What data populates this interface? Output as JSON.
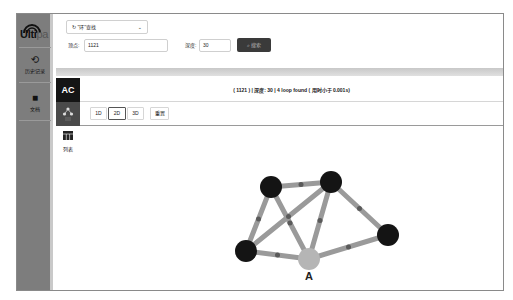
{
  "sidebar": {
    "logo": "Ultipa",
    "items": [
      {
        "label": "历史记录",
        "icon": "history-icon"
      },
      {
        "label": "文档",
        "icon": "document-icon"
      }
    ]
  },
  "query": {
    "mode_select": "\"环\"查找",
    "mode_icon": "loop-icon",
    "vertex_label": "顶点:",
    "vertex_value": "1121",
    "depth_label": "深度:",
    "depth_value": "30",
    "search_button": "搜索"
  },
  "result": {
    "tab_ac": "AC",
    "tab_list_label": "列表",
    "status": "( 1121 ) | 深度: 30 | 4 loop found ( 用时小于 0.001s)",
    "toolbar": [
      "1D",
      "2D",
      "3D",
      "重置"
    ],
    "active_view": "2D"
  },
  "graph": {
    "nodes": [
      {
        "id": "n1",
        "x": 254,
        "y": 173,
        "color": "#141414"
      },
      {
        "id": "n2",
        "x": 314,
        "y": 168,
        "color": "#141414"
      },
      {
        "id": "n3",
        "x": 371,
        "y": 221,
        "color": "#141414"
      },
      {
        "id": "n4",
        "x": 229,
        "y": 237,
        "color": "#141414"
      },
      {
        "id": "A",
        "x": 292,
        "y": 245,
        "color": "#b5b5b5",
        "label": "A"
      }
    ],
    "edges": [
      [
        "n1",
        "n2"
      ],
      [
        "n1",
        "n4"
      ],
      [
        "n1",
        "A"
      ],
      [
        "n2",
        "n4"
      ],
      [
        "n2",
        "A"
      ],
      [
        "n2",
        "n3"
      ],
      [
        "n3",
        "A"
      ],
      [
        "n4",
        "A"
      ]
    ],
    "edge_color": "#9a9a9a",
    "edge_dark": "#5a5a5a"
  }
}
